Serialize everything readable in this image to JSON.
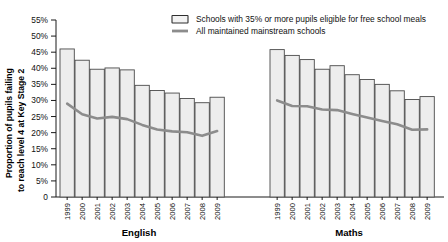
{
  "chart_data": {
    "type": "bar",
    "title": "",
    "xlabel": "",
    "ylabel": "Proportion of pupils failing to reach level 4 at Key Stage 2",
    "ylabel_line1": "Proportion of pupils failing",
    "ylabel_line2": "to reach level 4 at Key Stage 2",
    "ylim": [
      0,
      55
    ],
    "ytick_labels": [
      "0",
      "5%",
      "10%",
      "15%",
      "20%",
      "25%",
      "30%",
      "35%",
      "40%",
      "45%",
      "50%",
      "55%"
    ],
    "ytick_values": [
      0,
      5,
      10,
      15,
      20,
      25,
      30,
      35,
      40,
      45,
      50,
      55
    ],
    "grid": false,
    "legend_position": "top-right",
    "legend": [
      {
        "key": "fsm-schools",
        "label": "Schools with 35% or more pupils eligible for free school meals",
        "marker": "bar-swatch",
        "color": "#ededed"
      },
      {
        "key": "all-schools",
        "label": "All maintained mainstream schools",
        "marker": "line-swatch",
        "color": "#8c8c8c"
      }
    ],
    "groups": [
      {
        "name": "English",
        "label": "English",
        "categories": [
          "1999",
          "2000",
          "2001",
          "2002",
          "2003",
          "2004",
          "2005",
          "2006",
          "2007",
          "2008",
          "2009"
        ],
        "series": [
          {
            "name": "Schools with 35% or more pupils eligible for free school meals",
            "type": "bar",
            "values": [
              46.0,
              42.5,
              39.7,
              40.1,
              39.5,
              34.7,
              33.1,
              32.3,
              30.6,
              29.3,
              31.0
            ]
          },
          {
            "name": "All maintained mainstream schools",
            "type": "line",
            "values": [
              29.0,
              25.7,
              24.4,
              24.9,
              24.2,
              22.4,
              21.0,
              20.4,
              20.1,
              19.0,
              20.5
            ]
          }
        ]
      },
      {
        "name": "Maths",
        "label": "Maths",
        "categories": [
          "1999",
          "2000",
          "2001",
          "2002",
          "2003",
          "2004",
          "2005",
          "2006",
          "2007",
          "2008",
          "2009"
        ],
        "series": [
          {
            "name": "Schools with 35% or more pupils eligible for free school meals",
            "type": "bar",
            "values": [
              45.8,
              44.0,
              42.7,
              39.7,
              40.8,
              38.0,
              36.5,
              35.0,
              33.0,
              30.3,
              31.2
            ]
          },
          {
            "name": "All maintained mainstream schools",
            "type": "line",
            "values": [
              30.0,
              28.3,
              28.2,
              27.2,
              27.0,
              25.8,
              24.7,
              23.6,
              22.6,
              20.9,
              21.0
            ]
          }
        ]
      }
    ]
  }
}
